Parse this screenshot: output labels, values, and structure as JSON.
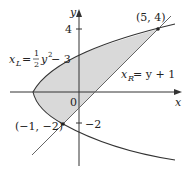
{
  "figure": {
    "colors": {
      "region_fill": "#d9d9d9",
      "curve": "#333333",
      "line": "#555555",
      "axis": "#333333",
      "point": "#222222"
    },
    "axes": {
      "x_label": "x",
      "y_label": "y",
      "origin_label": "0",
      "y_ticks": [
        {
          "value": 4,
          "label": "4"
        },
        {
          "value": -2,
          "label": "−2"
        }
      ]
    },
    "curves": {
      "parabola": {
        "name": "x_L",
        "label_var": "x",
        "label_sub": "L",
        "label_eq": "= ",
        "label_frac_num": "1",
        "label_frac_den": "2",
        "label_rest": "y",
        "label_exp": "2",
        "label_tail": " − 3"
      },
      "line": {
        "name": "x_R",
        "label_var": "x",
        "label_sub": "R",
        "label_rest": " = y + 1"
      }
    },
    "points": [
      {
        "label": "(5, 4)",
        "x": 5,
        "y": 4
      },
      {
        "label": "(−1, −2)",
        "x": -1,
        "y": -2
      }
    ],
    "shaded_region": "between x = y²/2 − 3 and x = y + 1 for −2 ≤ y ≤ 4"
  }
}
